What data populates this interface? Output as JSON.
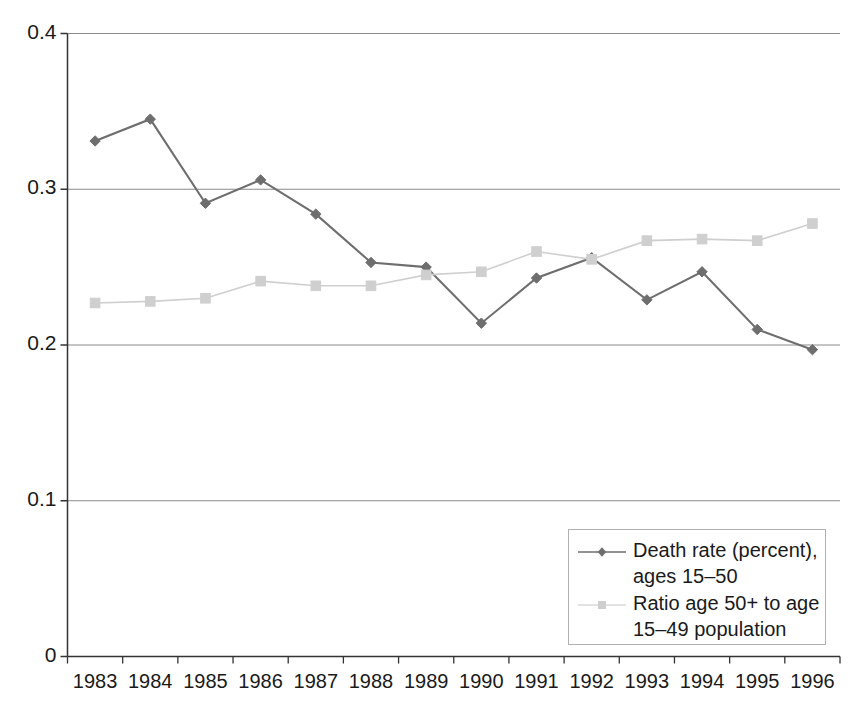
{
  "chart_data": {
    "type": "line",
    "title": "",
    "xlabel": "",
    "ylabel": "",
    "categories": [
      "1983",
      "1984",
      "1985",
      "1986",
      "1987",
      "1988",
      "1989",
      "1990",
      "1991",
      "1992",
      "1993",
      "1994",
      "1995",
      "1996"
    ],
    "ylim": [
      0,
      0.4
    ],
    "y_ticks": [
      "0",
      "0.1",
      "0.2",
      "0.3",
      "0.4"
    ],
    "y_tick_values": [
      0,
      0.1,
      0.2,
      0.3,
      0.4
    ],
    "grid": "horizontal",
    "legend_position": "bottom-right",
    "series": [
      {
        "name": "Death rate (percent), ages 15–50",
        "color": "#6e6e6e",
        "marker": "diamond",
        "values": [
          0.331,
          0.345,
          0.291,
          0.306,
          0.284,
          0.253,
          0.25,
          0.214,
          0.243,
          0.256,
          0.229,
          0.247,
          0.21,
          0.197
        ]
      },
      {
        "name": "Ratio age 50+ to age 15–49 population",
        "color": "#cfcfcf",
        "marker": "square",
        "values": [
          0.227,
          0.228,
          0.23,
          0.241,
          0.238,
          0.238,
          0.245,
          0.247,
          0.26,
          0.255,
          0.267,
          0.268,
          0.267,
          0.278
        ]
      }
    ]
  },
  "legend": {
    "entries": [
      {
        "label_line1": "Death rate (percent),",
        "label_line2": "ages 15–50"
      },
      {
        "label_line1": "Ratio age 50+ to age",
        "label_line2": "15–49 population"
      }
    ]
  },
  "axes": {
    "y_tick_labels": [
      "0.4",
      "0.3",
      "0.2",
      "0.1",
      "0"
    ],
    "x_tick_labels": [
      "1983",
      "1984",
      "1985",
      "1986",
      "1987",
      "1988",
      "1989",
      "1990",
      "1991",
      "1992",
      "1993",
      "1994",
      "1995",
      "1996"
    ]
  }
}
